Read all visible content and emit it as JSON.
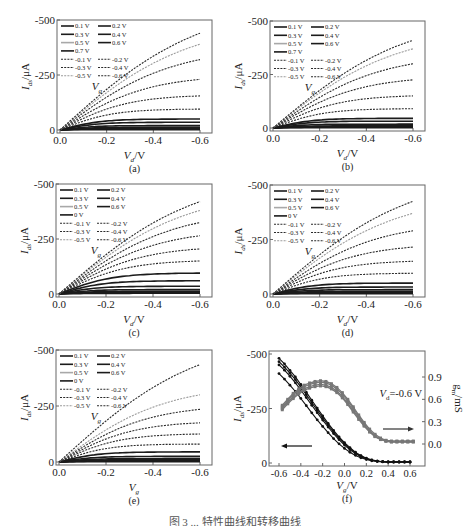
{
  "figure_caption": "图 3 ... 特性曲线和转移曲线",
  "chart_data": [
    {
      "id": "a",
      "type": "line",
      "panel_label": "(a)",
      "xlabel": "V_d/V",
      "ylabel": "I_ds/μA",
      "xlim": [
        0.0,
        -0.6
      ],
      "ylim": [
        0,
        -500
      ],
      "xticks": [
        "0.0",
        "-0.2",
        "-0.4",
        "-0.6"
      ],
      "yticks": [
        "0",
        "-250",
        "-500"
      ],
      "grid": false,
      "legend_placement": "top-left",
      "legend_title": "V_g",
      "legend": [
        "0.1 V",
        "0.2 V",
        "0.3 V",
        "0.4 V",
        "0.5 V",
        "0.6 V",
        "0.7 V",
        "-0.1 V",
        "-0.2 V",
        "-0.3 V",
        "-0.4 V",
        "-0.5 V",
        "-0.6 V"
      ],
      "series": [
        {
          "name": "0.7 V",
          "style": "solid",
          "sat": 2
        },
        {
          "name": "0.6 V",
          "style": "solid",
          "sat": 5
        },
        {
          "name": "0.5 V",
          "style": "solid",
          "sat": 8
        },
        {
          "name": "0.4 V",
          "style": "solid",
          "sat": 12
        },
        {
          "name": "0.3 V",
          "style": "solid",
          "sat": 20
        },
        {
          "name": "0.2 V",
          "style": "solid",
          "sat": 35
        },
        {
          "name": "0.1 V",
          "style": "solid",
          "sat": 50
        },
        {
          "name": "-0.1 V",
          "style": "dashed",
          "sat": 95
        },
        {
          "name": "-0.2 V",
          "style": "dashed",
          "sat": 155
        },
        {
          "name": "-0.3 V",
          "style": "dashed",
          "sat": 230
        },
        {
          "name": "-0.4 V",
          "style": "dashed",
          "sat": 320
        },
        {
          "name": "-0.5 V",
          "style": "dashed-light",
          "sat": 390
        },
        {
          "name": "-0.6 V",
          "style": "dashed",
          "sat": 440
        }
      ]
    },
    {
      "id": "b",
      "type": "line",
      "panel_label": "(b)",
      "xlabel": "V_d/V",
      "ylabel": "I_ds/μA",
      "xlim": [
        0.0,
        -0.6
      ],
      "ylim": [
        0,
        -500
      ],
      "xticks": [
        "0.0",
        "-0.2",
        "-0.4",
        "-0.6"
      ],
      "yticks": [
        "0",
        "-250",
        "-500"
      ],
      "grid": false,
      "legend_placement": "top-left",
      "legend_title": "V_g",
      "legend": [
        "0.1 V",
        "0.2 V",
        "0.3 V",
        "0.4 V",
        "0.5 V",
        "0.6 V",
        "0.7 V",
        "-0.1 V",
        "-0.2 V",
        "-0.3 V",
        "-0.4 V",
        "-0.5 V",
        "-0.6 V"
      ],
      "series": [
        {
          "name": "0.7 V",
          "style": "solid",
          "sat": 2
        },
        {
          "name": "0.6 V",
          "style": "solid",
          "sat": 4
        },
        {
          "name": "0.5 V",
          "style": "solid",
          "sat": 7
        },
        {
          "name": "0.4 V",
          "style": "solid",
          "sat": 10
        },
        {
          "name": "0.3 V",
          "style": "solid",
          "sat": 18
        },
        {
          "name": "0.2 V",
          "style": "solid",
          "sat": 32
        },
        {
          "name": "0.1 V",
          "style": "solid",
          "sat": 45
        },
        {
          "name": "-0.1 V",
          "style": "dashed",
          "sat": 90
        },
        {
          "name": "-0.2 V",
          "style": "dashed",
          "sat": 150
        },
        {
          "name": "-0.3 V",
          "style": "dashed",
          "sat": 225
        },
        {
          "name": "-0.4 V",
          "style": "dashed",
          "sat": 300
        },
        {
          "name": "-0.5 V",
          "style": "dashed-light",
          "sat": 370
        },
        {
          "name": "-0.6 V",
          "style": "dashed",
          "sat": 410
        }
      ]
    },
    {
      "id": "c",
      "type": "line",
      "panel_label": "(c)",
      "xlabel": "V_d/V",
      "ylabel": "I_ds/μA",
      "xlim": [
        0.0,
        -0.6
      ],
      "ylim": [
        0,
        -500
      ],
      "xticks": [
        "0.0",
        "-0.2",
        "-0.4",
        "-0.6"
      ],
      "yticks": [
        "0",
        "-250",
        "-500"
      ],
      "grid": false,
      "legend_placement": "top-left",
      "legend_title": "V_g",
      "legend": [
        "0.1 V",
        "0.2 V",
        "0.3 V",
        "0.4 V",
        "0.5 V",
        "0.6 V",
        "0 V",
        "-0.1 V",
        "-0.2 V",
        "-0.3 V",
        "-0.4 V",
        "-0.5 V",
        "-0.6 V"
      ],
      "series": [
        {
          "name": "0.6 V",
          "style": "solid",
          "sat": 3
        },
        {
          "name": "0.5 V",
          "style": "solid",
          "sat": 7
        },
        {
          "name": "0.4 V",
          "style": "solid",
          "sat": 12
        },
        {
          "name": "0.3 V",
          "style": "solid",
          "sat": 20
        },
        {
          "name": "0.2 V",
          "style": "solid",
          "sat": 35
        },
        {
          "name": "0.1 V",
          "style": "solid",
          "sat": 60
        },
        {
          "name": "0 V",
          "style": "solid",
          "sat": 95
        },
        {
          "name": "-0.1 V",
          "style": "dashed",
          "sat": 150
        },
        {
          "name": "-0.2 V",
          "style": "dashed",
          "sat": 205
        },
        {
          "name": "-0.3 V",
          "style": "dashed",
          "sat": 265
        },
        {
          "name": "-0.4 V",
          "style": "dashed",
          "sat": 325
        },
        {
          "name": "-0.5 V",
          "style": "dashed-light",
          "sat": 380
        },
        {
          "name": "-0.6 V",
          "style": "dashed",
          "sat": 420
        }
      ]
    },
    {
      "id": "d",
      "type": "line",
      "panel_label": "(d)",
      "xlabel": "V_d/V",
      "ylabel": "I_ds/μA",
      "xlim": [
        0.0,
        -0.6
      ],
      "ylim": [
        0,
        -500
      ],
      "xticks": [
        "0.0",
        "-0.2",
        "-0.4",
        "-0.6"
      ],
      "yticks": [
        "0",
        "-250",
        "-500"
      ],
      "grid": false,
      "legend_placement": "top-left",
      "legend_title": "V_g",
      "legend": [
        "0.1 V",
        "0.2 V",
        "0.3 V",
        "0.4 V",
        "0.5 V",
        "0.6 V",
        "0 V",
        "-0.1 V",
        "-0.2 V",
        "-0.3 V",
        "-0.4 V",
        "-0.5 V",
        "-0.6 V"
      ],
      "series": [
        {
          "name": "0.6 V",
          "style": "solid",
          "sat": 2
        },
        {
          "name": "0.5 V",
          "style": "solid",
          "sat": 4
        },
        {
          "name": "0.4 V",
          "style": "solid",
          "sat": 7
        },
        {
          "name": "0.3 V",
          "style": "solid",
          "sat": 12
        },
        {
          "name": "0.2 V",
          "style": "solid",
          "sat": 20
        },
        {
          "name": "0.1 V",
          "style": "solid",
          "sat": 32
        },
        {
          "name": "0 V",
          "style": "solid",
          "sat": 50
        },
        {
          "name": "-0.1 V",
          "style": "dashed",
          "sat": 95
        },
        {
          "name": "-0.2 V",
          "style": "dashed",
          "sat": 150
        },
        {
          "name": "-0.3 V",
          "style": "dashed",
          "sat": 215
        },
        {
          "name": "-0.4 V",
          "style": "dashed",
          "sat": 290
        },
        {
          "name": "-0.5 V",
          "style": "dashed-light",
          "sat": 370
        },
        {
          "name": "-0.6 V",
          "style": "dashed",
          "sat": 425
        }
      ]
    },
    {
      "id": "e",
      "type": "line",
      "panel_label": "(e)",
      "xlabel": "V_g",
      "ylabel": "I_ds/μA",
      "xlim": [
        0.0,
        -0.6
      ],
      "ylim": [
        0,
        -500
      ],
      "xticks": [
        "0.0",
        "-0.2",
        "-0.4",
        "-0.6"
      ],
      "yticks": [
        "0",
        "-250",
        "-500"
      ],
      "grid": false,
      "legend_placement": "top-left",
      "legend_title": "V_g",
      "legend": [
        "0.1 V",
        "0.2 V",
        "0.3 V",
        "0.4 V",
        "0.5 V",
        "0.6 V",
        "0 V",
        "-0.1 V",
        "-0.2 V",
        "-0.3 V",
        "-0.4 V",
        "-0.5 V",
        "-0.6 V"
      ],
      "series": [
        {
          "name": "0.6 V",
          "style": "solid",
          "sat": 2
        },
        {
          "name": "0.5 V",
          "style": "solid",
          "sat": 4
        },
        {
          "name": "0.4 V",
          "style": "solid",
          "sat": 6
        },
        {
          "name": "0.3 V",
          "style": "solid",
          "sat": 10
        },
        {
          "name": "0.2 V",
          "style": "solid",
          "sat": 15
        },
        {
          "name": "0.1 V",
          "style": "solid",
          "sat": 25
        },
        {
          "name": "0 V",
          "style": "solid",
          "sat": 45
        },
        {
          "name": "-0.1 V",
          "style": "dashed",
          "sat": 80
        },
        {
          "name": "-0.2 V",
          "style": "dashed",
          "sat": 125
        },
        {
          "name": "-0.3 V",
          "style": "dashed",
          "sat": 175
        },
        {
          "name": "-0.4 V",
          "style": "dashed",
          "sat": 235
        },
        {
          "name": "-0.5 V",
          "style": "dashed-light",
          "sat": 300
        },
        {
          "name": "-0.6 V",
          "style": "dashed",
          "sat": 435
        }
      ]
    },
    {
      "id": "f",
      "type": "line",
      "panel_label": "(f)",
      "xlabel": "V_g/V",
      "ylabel": "I_ds/μA",
      "ylabel_right": "g_m/mS",
      "annotation": "V_d=-0.6 V",
      "xlim": [
        -0.7,
        0.65
      ],
      "ylim": [
        0,
        -500
      ],
      "ylim_right": [
        -0.1,
        1.0
      ],
      "xticks": [
        "-0.6",
        "-0.4",
        "-0.2",
        "0.0",
        "0.2",
        "0.4",
        "0.6"
      ],
      "yticks": [
        "0",
        "-250",
        "-500"
      ],
      "yticks_right": [
        "0.0",
        "0.3",
        "0.6",
        "0.9"
      ],
      "grid": false,
      "arrows": [
        {
          "direction": "left",
          "axis": "left"
        },
        {
          "direction": "right",
          "axis": "right"
        }
      ],
      "x": [
        -0.6,
        -0.55,
        -0.5,
        -0.45,
        -0.4,
        -0.35,
        -0.3,
        -0.25,
        -0.2,
        -0.15,
        -0.1,
        -0.05,
        0.0,
        0.05,
        0.1,
        0.15,
        0.2,
        0.25,
        0.3,
        0.35,
        0.4,
        0.45,
        0.5,
        0.55,
        0.6
      ],
      "ids_series": [
        {
          "name": "Ids 1",
          "values": [
            -480,
            -455,
            -425,
            -395,
            -360,
            -325,
            -288,
            -252,
            -216,
            -182,
            -150,
            -120,
            -93,
            -70,
            -50,
            -34,
            -22,
            -14,
            -9,
            -6,
            -5,
            -5,
            -5,
            -5,
            -5
          ]
        },
        {
          "name": "Ids 2",
          "values": [
            -465,
            -440,
            -412,
            -382,
            -348,
            -313,
            -277,
            -242,
            -207,
            -174,
            -143,
            -114,
            -88,
            -66,
            -47,
            -32,
            -21,
            -13,
            -9,
            -6,
            -5,
            -5,
            -5,
            -5,
            -5
          ]
        },
        {
          "name": "Ids 3",
          "values": [
            -450,
            -426,
            -398,
            -368,
            -335,
            -300,
            -265,
            -231,
            -197,
            -165,
            -135,
            -107,
            -82,
            -61,
            -43,
            -29,
            -19,
            -12,
            -8,
            -6,
            -5,
            -5,
            -5,
            -5,
            -5
          ]
        },
        {
          "name": "Ids 4",
          "values": [
            -410,
            -385,
            -357,
            -328,
            -296,
            -263,
            -230,
            -198,
            -168,
            -139,
            -112,
            -88,
            -67,
            -49,
            -35,
            -24,
            -16,
            -10,
            -7,
            -5,
            -4,
            -4,
            -4,
            -4,
            -4
          ]
        }
      ],
      "gm_series": [
        {
          "name": "gm 1",
          "values": [
            0.52,
            0.6,
            0.68,
            0.74,
            0.79,
            0.82,
            0.84,
            0.85,
            0.84,
            0.81,
            0.76,
            0.69,
            0.6,
            0.5,
            0.39,
            0.29,
            0.2,
            0.13,
            0.08,
            0.05,
            0.04,
            0.04,
            0.04,
            0.04,
            0.04
          ]
        },
        {
          "name": "gm 2",
          "values": [
            0.5,
            0.58,
            0.66,
            0.72,
            0.77,
            0.8,
            0.82,
            0.83,
            0.82,
            0.79,
            0.74,
            0.67,
            0.58,
            0.48,
            0.37,
            0.27,
            0.18,
            0.11,
            0.07,
            0.04,
            0.03,
            0.03,
            0.03,
            0.03,
            0.03
          ]
        },
        {
          "name": "gm 3",
          "values": [
            0.48,
            0.56,
            0.63,
            0.69,
            0.74,
            0.77,
            0.79,
            0.8,
            0.79,
            0.76,
            0.71,
            0.64,
            0.55,
            0.45,
            0.35,
            0.25,
            0.17,
            0.1,
            0.06,
            0.04,
            0.03,
            0.03,
            0.03,
            0.03,
            0.03
          ]
        },
        {
          "name": "gm 4",
          "values": [
            0.46,
            0.54,
            0.61,
            0.67,
            0.72,
            0.75,
            0.77,
            0.78,
            0.77,
            0.74,
            0.69,
            0.62,
            0.53,
            0.43,
            0.33,
            0.24,
            0.16,
            0.1,
            0.06,
            0.04,
            0.03,
            0.03,
            0.03,
            0.03,
            0.03
          ]
        }
      ]
    }
  ]
}
